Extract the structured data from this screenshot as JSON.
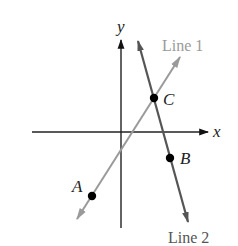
{
  "diagram": {
    "axes": {
      "x_label": "x",
      "y_label": "y",
      "color": "#222222"
    },
    "lines": [
      {
        "name": "Line 1",
        "label": "Line 1",
        "color": "#9a9a9a",
        "slope_sign": "positive"
      },
      {
        "name": "Line 2",
        "label": "Line 2",
        "color": "#555555",
        "slope_sign": "negative"
      }
    ],
    "points": [
      {
        "label": "A",
        "on": "Line 1"
      },
      {
        "label": "B",
        "on": "Line 2"
      },
      {
        "label": "C",
        "on": "Line 1 and Line 2 (intersection)"
      }
    ],
    "point_color": "#000000"
  }
}
